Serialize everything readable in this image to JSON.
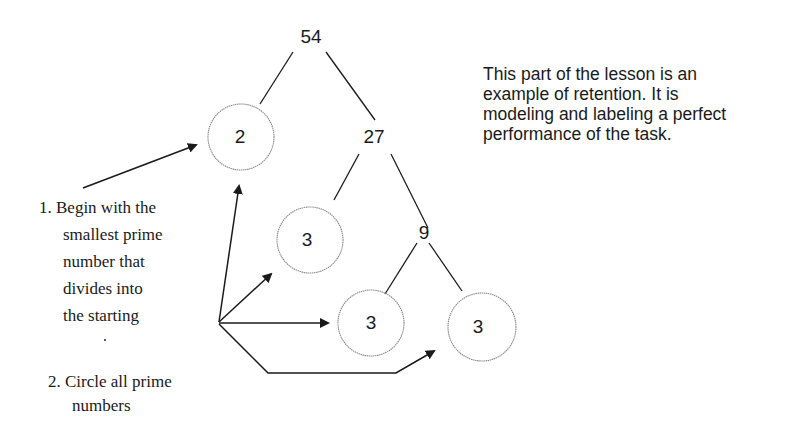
{
  "diagram": {
    "tree": {
      "root": "54",
      "nodes": [
        {
          "id": "n54",
          "label": "54",
          "prime": false,
          "x": 310,
          "y": 37
        },
        {
          "id": "n2",
          "label": "2",
          "prime": true,
          "x": 239,
          "y": 137
        },
        {
          "id": "n27",
          "label": "27",
          "prime": false,
          "x": 374,
          "y": 137
        },
        {
          "id": "n3a",
          "label": "3",
          "prime": true,
          "x": 310,
          "y": 240
        },
        {
          "id": "n9",
          "label": "9",
          "prime": false,
          "x": 423,
          "y": 233
        },
        {
          "id": "n3b",
          "label": "3",
          "prime": true,
          "x": 371,
          "y": 323
        },
        {
          "id": "n3c",
          "label": "3",
          "prime": true,
          "x": 481,
          "y": 327
        }
      ],
      "edges": [
        [
          "54",
          "2"
        ],
        [
          "54",
          "27"
        ],
        [
          "27",
          "3"
        ],
        [
          "27",
          "9"
        ],
        [
          "9",
          "3"
        ],
        [
          "9",
          "3"
        ]
      ]
    },
    "note": {
      "lines": [
        "This part of the lesson is an",
        "example of retention.  It is",
        "modeling and labeling a perfect",
        "performance of the task."
      ]
    },
    "steps": [
      {
        "number": "1.",
        "lines": [
          "1. Begin with the",
          "smallest prime",
          "number that",
          "divides into",
          "the starting"
        ]
      },
      {
        "number": "2.",
        "lines": [
          "2. Circle all prime",
          "numbers"
        ]
      }
    ],
    "colors": {
      "line": "#1a1a1a",
      "circle_stroke": "#8a8a8a",
      "text": "#1a1a1a",
      "background": "#ffffff"
    }
  }
}
